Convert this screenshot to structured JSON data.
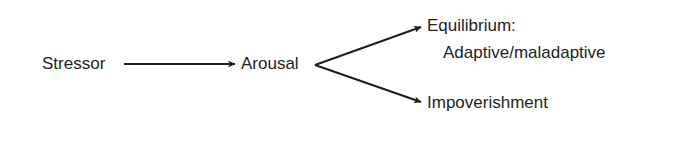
{
  "diagram": {
    "type": "flow",
    "nodes": [
      {
        "id": "stressor",
        "label": "Stressor"
      },
      {
        "id": "arousal",
        "label": "Arousal"
      },
      {
        "id": "equilibrium",
        "label": "Equilibrium:",
        "sublabel": "Adaptive/maladaptive"
      },
      {
        "id": "impoverishment",
        "label": "Impoverishment"
      }
    ],
    "edges": [
      {
        "from": "stressor",
        "to": "arousal"
      },
      {
        "from": "arousal",
        "to": "equilibrium"
      },
      {
        "from": "arousal",
        "to": "impoverishment"
      }
    ],
    "colors": {
      "stroke": "#1e1e1e",
      "text": "#1e1e1e",
      "background": "#ffffff"
    }
  }
}
